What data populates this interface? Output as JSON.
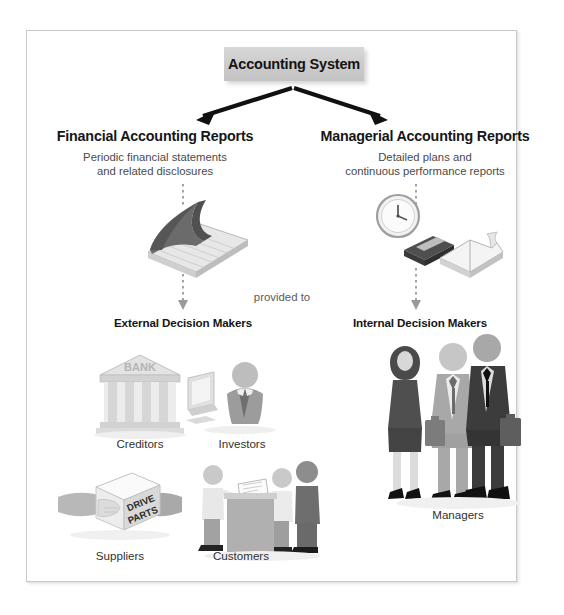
{
  "diagram": {
    "title": "Accounting System",
    "root": {
      "label": "Accounting System"
    },
    "connector_label": "provided to",
    "branches": [
      {
        "id": "financial",
        "heading": "Financial Accounting Reports",
        "subtitle_line1": "Periodic financial statements",
        "subtitle_line2": "and related disclosures",
        "icon_name": "ledger-book-icon",
        "recipient_heading": "External Decision Makers",
        "recipients": [
          {
            "label": "Creditors",
            "icon_name": "bank-building-icon",
            "sign_text": "BANK"
          },
          {
            "label": "Investors",
            "icon_name": "investor-at-monitor-icon"
          },
          {
            "label": "Suppliers",
            "icon_name": "hands-holding-box-icon",
            "box_text_line1": "DRIVE",
            "box_text_line2": "PARTS"
          },
          {
            "label": "Customers",
            "icon_name": "customers-at-counter-icon"
          }
        ]
      },
      {
        "id": "managerial",
        "heading": "Managerial Accounting Reports",
        "subtitle_line1": "Detailed plans and",
        "subtitle_line2": "continuous performance reports",
        "icon_name": "clock-and-books-icon",
        "recipient_heading": "Internal Decision Makers",
        "recipients": [
          {
            "label": "Managers",
            "icon_name": "three-business-people-icon"
          }
        ]
      }
    ],
    "colors": {
      "box_fill": "#cdcdcd",
      "arrow": "#111111",
      "dotted_arrow": "#9a9a9a",
      "frame_border": "#c9c9c9",
      "heading_text": "#161616",
      "subtitle_text": "#4a4a4a"
    }
  }
}
